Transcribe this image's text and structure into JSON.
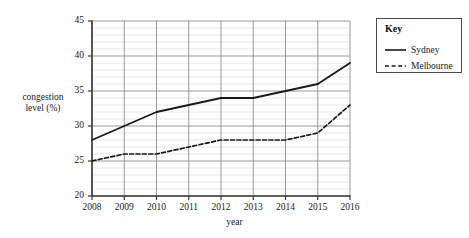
{
  "chart_data": {
    "type": "line",
    "title": "",
    "xlabel": "year",
    "ylabel": "congestion level (%)",
    "ylabel_line1": "congestion",
    "ylabel_line2": "level (%)",
    "x": [
      2008,
      2009,
      2010,
      2011,
      2012,
      2013,
      2014,
      2015,
      2016
    ],
    "categories": [
      "2008",
      "2009",
      "2010",
      "2011",
      "2012",
      "2013",
      "2014",
      "2015",
      "2016"
    ],
    "xlim": [
      2008,
      2016
    ],
    "ylim": [
      20,
      45
    ],
    "ytick_labels": [
      "20",
      "25",
      "30",
      "35",
      "40",
      "45"
    ],
    "ytick_values": [
      20,
      25,
      30,
      35,
      40,
      45
    ],
    "ymajor_step": 5,
    "yminor_step": 1,
    "grid": "major and minor horizontal, major vertical",
    "legend_position": "right outside",
    "series": [
      {
        "name": "Sydney",
        "style": "solid",
        "color": "#1a1a1a",
        "values": [
          28,
          30,
          32,
          33,
          34,
          34,
          35,
          36,
          39
        ]
      },
      {
        "name": "Melbourne",
        "style": "dashed",
        "color": "#1a1a1a",
        "values": [
          25,
          26,
          26,
          27,
          28,
          28,
          28,
          29,
          33
        ]
      }
    ]
  },
  "key": {
    "title": "Key",
    "entries": [
      {
        "label": "Sydney",
        "style": "solid"
      },
      {
        "label": "Melbourne",
        "style": "dashed"
      }
    ]
  },
  "colors": {
    "line": "#1a1a1a",
    "axis": "#3a3a3a",
    "major_grid": "#8e8e8e",
    "minor_grid": "#dcdcdc",
    "background": "#ffffff"
  }
}
